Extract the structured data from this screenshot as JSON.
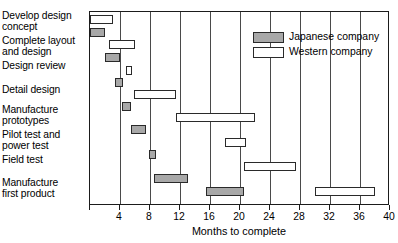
{
  "chart_data": {
    "type": "bar",
    "subtype": "gantt",
    "title": "",
    "xlabel": "Months to complete",
    "ylabel": "",
    "xlim": [
      0,
      40
    ],
    "xticks": [
      0,
      4,
      8,
      12,
      16,
      20,
      24,
      28,
      32,
      36,
      40
    ],
    "xtick_labels": [
      "",
      "4",
      "8",
      "12",
      "16",
      "20",
      "24",
      "28",
      "32",
      "36",
      "40"
    ],
    "grid": "vertical",
    "legend_position": "top-right",
    "categories": [
      "Develop design concept",
      "Complete layout and design",
      "Design review",
      "Detail design",
      "Manufacture prototypes",
      "Pilot test and power test",
      "Field test",
      "Manufacture first product"
    ],
    "series": [
      {
        "name": "Japanese company",
        "color": "#a8a8a8",
        "tasks": [
          {
            "task": "Develop design concept",
            "start": 0.0,
            "end": 2.0,
            "duration": 2.0
          },
          {
            "task": "Complete layout and design",
            "start": 2.0,
            "end": 4.0,
            "duration": 2.0
          },
          {
            "task": "Design review",
            "start": 3.3,
            "end": 4.4,
            "duration": 1.1
          },
          {
            "task": "Detail design",
            "start": 4.3,
            "end": 5.5,
            "duration": 1.2
          },
          {
            "task": "Manufacture prototypes",
            "start": 5.5,
            "end": 7.5,
            "duration": 2.0
          },
          {
            "task": "Pilot test and power test",
            "start": 7.8,
            "end": 8.8,
            "duration": 1.0
          },
          {
            "task": "Field test",
            "start": 8.5,
            "end": 13.0,
            "duration": 4.5
          },
          {
            "task": "Manufacture first product",
            "start": 15.5,
            "end": 20.5,
            "duration": 5.0
          }
        ]
      },
      {
        "name": "Western company",
        "color": "#ffffff",
        "tasks": [
          {
            "task": "Develop design concept",
            "start": 0.0,
            "end": 3.0,
            "duration": 3.0
          },
          {
            "task": "Complete layout and design",
            "start": 2.5,
            "end": 6.0,
            "duration": 3.5
          },
          {
            "task": "Design review",
            "start": 4.8,
            "end": 5.6,
            "duration": 0.8
          },
          {
            "task": "Detail design",
            "start": 5.8,
            "end": 11.5,
            "duration": 5.7
          },
          {
            "task": "Manufacture prototypes",
            "start": 11.5,
            "end": 22.0,
            "duration": 10.5
          },
          {
            "task": "Pilot test and power test",
            "start": 18.0,
            "end": 20.8,
            "duration": 2.8
          },
          {
            "task": "Field test",
            "start": 20.5,
            "end": 27.5,
            "duration": 7.0
          },
          {
            "task": "Manufacture first product",
            "start": 30.0,
            "end": 38.0,
            "duration": 8.0
          }
        ]
      }
    ],
    "legend": [
      {
        "label": "Japanese company",
        "swatch": "filled-gray"
      },
      {
        "label": "Western company",
        "swatch": "outline-white"
      }
    ]
  },
  "labels": {
    "tasks": [
      {
        "lines": [
          "Develop design",
          "concept"
        ],
        "top": 0
      },
      {
        "lines": [
          "Complete layout",
          "and design"
        ],
        "top": 25
      },
      {
        "lines": [
          "Design review"
        ],
        "top": 50
      },
      {
        "lines": [
          "Detail design"
        ],
        "top": 74
      },
      {
        "lines": [
          "Manufacture",
          "prototypes"
        ],
        "top": 94
      },
      {
        "lines": [
          "Pilot test and",
          "power test"
        ],
        "top": 119
      },
      {
        "lines": [
          "Field test"
        ],
        "top": 144
      },
      {
        "lines": [
          "Manufacture",
          "first product"
        ],
        "top": 167
      }
    ]
  },
  "axis": {
    "title": "Months to complete",
    "ticks": [
      "",
      "4",
      "8",
      "12",
      "16",
      "20",
      "24",
      "28",
      "32",
      "36",
      "40"
    ]
  },
  "legend": {
    "japanese_label": "Japanese company",
    "western_label": "Western company"
  }
}
